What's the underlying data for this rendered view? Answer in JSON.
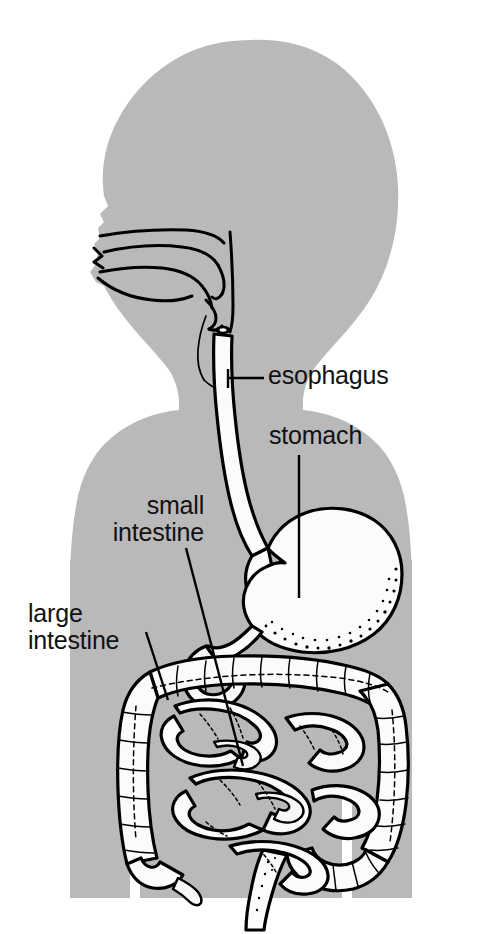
{
  "figure": {
    "background_color": "#ffffff",
    "body_color": "#b9b9b9",
    "organ_color": "#fbfbfb",
    "line_color": "#000000"
  },
  "labels": {
    "esophagus": "esophagus",
    "stomach": "stomach",
    "small_intestine_line1": "small",
    "small_intestine_line2": "intestine",
    "large_intestine_line1": "large",
    "large_intestine_line2": "intestine"
  },
  "organs": [
    {
      "name": "nasal-cavity",
      "label": ""
    },
    {
      "name": "oral-cavity",
      "label": ""
    },
    {
      "name": "tongue",
      "label": ""
    },
    {
      "name": "pharynx",
      "label": ""
    },
    {
      "name": "epiglottis",
      "label": ""
    },
    {
      "name": "trachea",
      "label": ""
    },
    {
      "name": "esophagus",
      "label": "esophagus"
    },
    {
      "name": "stomach",
      "label": "stomach"
    },
    {
      "name": "duodenum",
      "label": ""
    },
    {
      "name": "small-intestine",
      "label": "small intestine"
    },
    {
      "name": "large-intestine",
      "label": "large intestine"
    },
    {
      "name": "appendix",
      "label": ""
    },
    {
      "name": "rectum",
      "label": ""
    }
  ]
}
